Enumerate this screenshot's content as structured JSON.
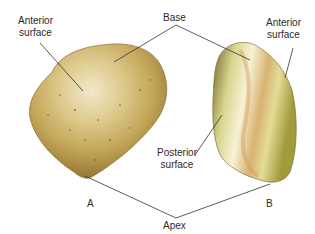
{
  "figure": {
    "type": "anatomical-illustration",
    "labels": {
      "anterior_surface_a_line1": "Anterior",
      "anterior_surface_a_line2": "surface",
      "base": "Base",
      "anterior_surface_b_line1": "Anterior",
      "anterior_surface_b_line2": "surface",
      "posterior_surface_line1": "Posterior",
      "posterior_surface_line2": "surface",
      "view_a": "A",
      "view_b": "B",
      "apex": "Apex"
    },
    "colors": {
      "leader_line": "#333333",
      "bone_light": "#efe6c2",
      "bone_mid": "#cdb064",
      "bone_dark": "#8c6a2a",
      "bone_b_tint": "#c9c06a"
    }
  }
}
